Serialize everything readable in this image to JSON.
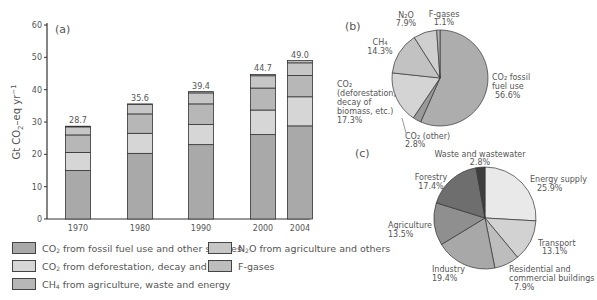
{
  "chart_data": [
    {
      "id": "a",
      "type": "bar",
      "stacked": true,
      "panel_label": "(a)",
      "title": "",
      "xlabel": "",
      "ylabel": "Gt CO2-eq yr-1",
      "ylim": [
        0,
        60
      ],
      "yticks": [
        0,
        10,
        20,
        30,
        40,
        50,
        60
      ],
      "grid": false,
      "categories": [
        "1970",
        "1980",
        "1990",
        "2000",
        "2004"
      ],
      "totals": [
        28.7,
        35.6,
        39.4,
        44.7,
        49.0
      ],
      "series": [
        {
          "name": "CO2 from fossil fuel use and other sources",
          "color": "#a9a9a9",
          "values": [
            15.0,
            20.3,
            23.0,
            26.1,
            28.8
          ]
        },
        {
          "name": "CO2 from deforestation, decay and peat",
          "color": "#d6d6d6",
          "values": [
            5.6,
            6.2,
            6.2,
            7.6,
            9.0
          ]
        },
        {
          "name": "CH4 from agriculture, waste and energy",
          "color": "#b7b7b7",
          "values": [
            5.4,
            6.0,
            6.4,
            6.8,
            6.6
          ]
        },
        {
          "name": "N2O from agriculture and others",
          "color": "#c6c6c6",
          "values": [
            2.5,
            2.9,
            3.4,
            3.8,
            3.9
          ]
        },
        {
          "name": "F-gases",
          "color": "#bdbdbd",
          "values": [
            0.2,
            0.2,
            0.4,
            0.4,
            0.7
          ]
        }
      ],
      "legend_position": "bottom"
    },
    {
      "id": "b",
      "type": "pie",
      "panel_label": "(b)",
      "slices": [
        {
          "label": "CO2 fossil fuel use",
          "value": 56.6,
          "color": "#adadad"
        },
        {
          "label": "CO2 (other)",
          "value": 2.8,
          "color": "#9a9a9a"
        },
        {
          "label": "CO2 (deforestation, decay of biomass, etc.)",
          "value": 17.3,
          "color": "#d4d4d4"
        },
        {
          "label": "CH4",
          "value": 14.3,
          "color": "#c2c2c2"
        },
        {
          "label": "N2O",
          "value": 7.9,
          "color": "#cfcfcf"
        },
        {
          "label": "F-gases",
          "value": 1.1,
          "color": "#b5b5b5"
        }
      ]
    },
    {
      "id": "c",
      "type": "pie",
      "panel_label": "(c)",
      "slices": [
        {
          "label": "Energy supply",
          "value": 25.9,
          "color": "#e9e9e9"
        },
        {
          "label": "Transport",
          "value": 13.1,
          "color": "#d2d2d2"
        },
        {
          "label": "Residential and commercial buildings",
          "value": 7.9,
          "color": "#bdbdbd"
        },
        {
          "label": "Industry",
          "value": 19.4,
          "color": "#a8a8a8"
        },
        {
          "label": "Agriculture",
          "value": 13.5,
          "color": "#8f8f8f"
        },
        {
          "label": "Forestry",
          "value": 17.4,
          "color": "#6e6e6e"
        },
        {
          "label": "Waste and wastewater",
          "value": 2.8,
          "color": "#3e3e3e"
        }
      ]
    }
  ],
  "panel_a": {
    "label": "(a)",
    "ylabel_main": "Gt CO",
    "ylabel_sub": "2",
    "ylabel_rest": "–eq yr",
    "ylabel_sup": "−1",
    "value_labels": [
      "28.7",
      "35.6",
      "39.4",
      "44.7",
      "49.0"
    ],
    "xticks": [
      "1970",
      "1980",
      "1990",
      "2000",
      "2004"
    ],
    "yticks": [
      "0",
      "10",
      "20",
      "30",
      "40",
      "50",
      "60"
    ]
  },
  "legend": {
    "items": [
      {
        "pre": "CO",
        "sub": "2",
        "post": " from fossil fuel use and other sources",
        "color": "#a9a9a9"
      },
      {
        "pre": "CO",
        "sub": "2",
        "post": " from deforestation, decay and peat",
        "color": "#d6d6d6"
      },
      {
        "pre": "CH",
        "sub": "4",
        "post": " from agriculture, waste and energy",
        "color": "#b7b7b7"
      },
      {
        "pre": "N",
        "sub": "2",
        "post": "O from agriculture and others",
        "color": "#c6c6c6"
      },
      {
        "pre": "F-gases",
        "sub": "",
        "post": "",
        "color": "#bdbdbd"
      }
    ]
  },
  "panel_b": {
    "label": "(b)",
    "labels": {
      "n2o_name": "N₂O",
      "n2o_pct": "7.9%",
      "fgas_name": "F-gases",
      "fgas_pct": "1.1%",
      "ch4_name": "CH₄",
      "ch4_pct": "14.3%",
      "defor_l1": "CO₂",
      "defor_l2": "(deforestation,",
      "defor_l3": "decay of",
      "defor_l4": "biomass, etc.)",
      "defor_pct": "17.3%",
      "fossil_l1": "CO₂ fossil",
      "fossil_l2": "fuel use",
      "fossil_pct": "56.6%",
      "other_name": "CO₂ (other)",
      "other_pct": "2.8%"
    }
  },
  "panel_c": {
    "label": "(c)",
    "labels": {
      "waste_name": "Waste and wastewater",
      "waste_pct": "2.8%",
      "forestry_name": "Forestry",
      "forestry_pct": "17.4%",
      "energy_name": "Energy supply",
      "energy_pct": "25.9%",
      "agri_name": "Agriculture",
      "agri_pct": "13.5%",
      "transport_name": "Transport",
      "transport_pct": "13.1%",
      "industry_name": "Industry",
      "industry_pct": "19.4%",
      "res_l1": "Residential and",
      "res_l2": "commercial buildings",
      "res_pct": "7.9%"
    }
  }
}
